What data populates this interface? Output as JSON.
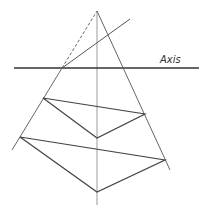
{
  "diagram": {
    "title": "",
    "axis_label": "Axis",
    "colors": {
      "line": "#555555",
      "axis": "#333333",
      "vertical": "#999999",
      "background": "#ffffff"
    },
    "points": {
      "apex": [
        97,
        11
      ],
      "axis_intersection": [
        62,
        68
      ],
      "upper_ray_end": [
        130,
        19
      ],
      "left_line_end": [
        12,
        150
      ],
      "right_line_end": [
        170,
        170
      ],
      "vertical_bottom": [
        97,
        205
      ],
      "upper_triangle": [
        [
          43,
          98
        ],
        [
          145,
          114
        ],
        [
          97,
          138
        ]
      ],
      "lower_triangle": [
        [
          20,
          137
        ],
        [
          165,
          160
        ],
        [
          97,
          192
        ]
      ]
    },
    "axis": {
      "y": 68,
      "x1": 14,
      "x2": 199
    }
  }
}
